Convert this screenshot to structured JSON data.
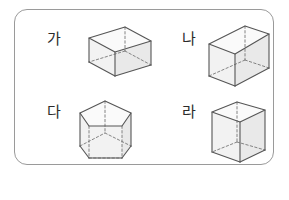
{
  "worksheet": {
    "panel_label": "figure-choices-panel",
    "answer_open_paren": "(",
    "answer_close_paren": ")",
    "figures": [
      {
        "label": "가",
        "label_name": "figure-label-ga",
        "shape": "rectangular-prism-wide",
        "position": "top-left"
      },
      {
        "label": "나",
        "label_name": "figure-label-na",
        "shape": "rectangular-prism-angled",
        "position": "top-right"
      },
      {
        "label": "다",
        "label_name": "figure-label-da",
        "shape": "pentagonal-prism",
        "position": "bottom-left"
      },
      {
        "label": "라",
        "label_name": "figure-label-ra",
        "shape": "rectangular-prism-tall",
        "position": "bottom-right"
      }
    ]
  },
  "colors": {
    "panel_border": "#9a9a9a",
    "edge_visible": "#555555",
    "edge_hidden": "#777777",
    "face_fill": "#f2f2f2",
    "text": "#2b2b2b",
    "paren": "#7d7d7d",
    "background": "#ffffff"
  }
}
